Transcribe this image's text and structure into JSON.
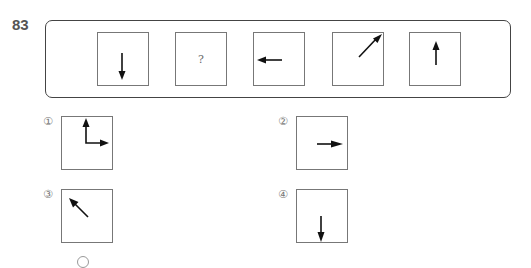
{
  "question": {
    "number": "83",
    "sequence": [
      {
        "type": "arrow",
        "icon": "arrow-down-icon"
      },
      {
        "type": "unknown",
        "label": "?"
      },
      {
        "type": "arrow",
        "icon": "arrow-left-icon"
      },
      {
        "type": "arrow",
        "icon": "arrow-up-right-icon"
      },
      {
        "type": "arrow",
        "icon": "arrow-up-icon"
      }
    ]
  },
  "options": [
    {
      "label": "①",
      "icon": "arrows-up-and-right-icon"
    },
    {
      "label": "②",
      "icon": "arrow-right-icon"
    },
    {
      "label": "③",
      "icon": "arrow-up-left-icon"
    },
    {
      "label": "④",
      "icon": "arrow-down-icon"
    }
  ]
}
